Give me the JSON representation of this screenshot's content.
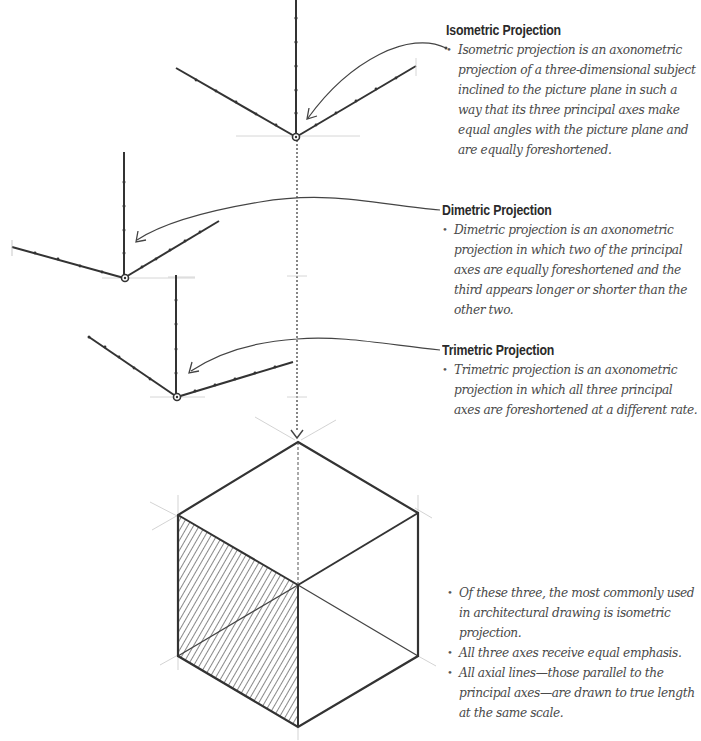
{
  "sections": {
    "isometric": {
      "heading": "Isometric Projection",
      "bullets": [
        "Isometric projection is an axonometric projection of a three-dimensional subject inclined to the picture plane in such a way that its three principal axes make equal angles with the picture plane and are equally foreshortened."
      ]
    },
    "dimetric": {
      "heading": "Dimetric Projection",
      "bullets": [
        "Dimetric projection is an axonometric projection in which two of the principal axes are equally foreshortened and the third appears longer or shorter than the other two."
      ]
    },
    "trimetric": {
      "heading": "Trimetric Projection",
      "bullets": [
        "Trimetric projection is an axonometric projection in which all three principal axes are foreshortened at a different rate."
      ]
    },
    "summary": {
      "bullets": [
        "Of these three, the most commonly used in architectural drawing is isometric projection.",
        "All three axes receive equal emphasis.",
        "All axial lines—those parallel to the principal axes—are drawn to true length at the same scale."
      ]
    }
  },
  "diagram": {
    "line_color": "#333333",
    "guide_color": "#bbbbbb",
    "hatch_color": "#555555",
    "figures": [
      {
        "name": "isometric-axes",
        "origin": [
          296,
          137
        ]
      },
      {
        "name": "dimetric-axes",
        "origin": [
          125,
          278
        ]
      },
      {
        "name": "trimetric-axes",
        "origin": [
          177,
          397
        ]
      },
      {
        "name": "isometric-cube",
        "top": [
          298,
          442
        ],
        "bottom": [
          298,
          727
        ]
      }
    ]
  }
}
